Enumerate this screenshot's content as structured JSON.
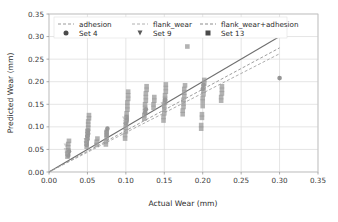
{
  "chart_data": {
    "type": "scatter",
    "title": "",
    "xlabel": "Actual Wear (mm)",
    "ylabel": "Predicted Wear (mm)",
    "xlim": [
      0.0,
      0.35
    ],
    "ylim": [
      0.0,
      0.35
    ],
    "xticks": [
      "0.00",
      "0.05",
      "0.10",
      "0.15",
      "0.20",
      "0.25",
      "0.30",
      "0.35"
    ],
    "yticks": [
      "0.00",
      "0.05",
      "0.10",
      "0.15",
      "0.20",
      "0.25",
      "0.30",
      "0.35"
    ],
    "xtick_values": [
      0.0,
      0.05,
      0.1,
      0.15,
      0.2,
      0.25,
      0.3,
      0.35
    ],
    "ytick_values": [
      0.0,
      0.05,
      0.1,
      0.15,
      0.2,
      0.25,
      0.3,
      0.35
    ],
    "grid": true,
    "legend_position": "upper center",
    "legend_lines": [
      {
        "label": "adhesion",
        "style": "dashed",
        "color": "#9a9a9a"
      },
      {
        "label": "flank_wear",
        "style": "dashed",
        "color": "#b0b0b0"
      },
      {
        "label": "flank_wear+adhesion",
        "style": "dashed",
        "color": "#8c8c8c"
      }
    ],
    "legend_markers": [
      {
        "label": "Set 4",
        "marker": "circle",
        "color": "#4a4a4a"
      },
      {
        "label": "Set 9",
        "marker": "triangle-down",
        "color": "#5a5a5a"
      },
      {
        "label": "Set 13",
        "marker": "square",
        "color": "#4a4a4a"
      }
    ],
    "trend_lines": [
      {
        "name": "adhesion",
        "style": "dashed",
        "color": "#9d9d9d",
        "x": [
          0.0,
          0.3
        ],
        "y": [
          0.0,
          0.275
        ]
      },
      {
        "name": "flank_wear",
        "style": "solid",
        "color": "#6f6f6f",
        "x": [
          0.0,
          0.3
        ],
        "y": [
          0.0,
          0.3
        ]
      },
      {
        "name": "flank_wear+adhesion",
        "style": "dashed",
        "color": "#adadad",
        "x": [
          0.0,
          0.3
        ],
        "y": [
          0.0,
          0.262
        ]
      }
    ],
    "series": [
      {
        "name": "Set 4",
        "marker": "circle",
        "color": "#7d7d7d",
        "points": [
          [
            0.025,
            0.036
          ],
          [
            0.025,
            0.04
          ],
          [
            0.026,
            0.046
          ],
          [
            0.049,
            0.06
          ],
          [
            0.049,
            0.066
          ],
          [
            0.05,
            0.072
          ],
          [
            0.05,
            0.079
          ],
          [
            0.051,
            0.085
          ],
          [
            0.051,
            0.092
          ],
          [
            0.075,
            0.082
          ],
          [
            0.075,
            0.089
          ],
          [
            0.076,
            0.096
          ],
          [
            0.1,
            0.108
          ],
          [
            0.101,
            0.115
          ],
          [
            0.101,
            0.122
          ],
          [
            0.125,
            0.131
          ],
          [
            0.126,
            0.139
          ],
          [
            0.15,
            0.152
          ],
          [
            0.151,
            0.16
          ],
          [
            0.2,
            0.184
          ],
          [
            0.201,
            0.193
          ],
          [
            0.3,
            0.208
          ]
        ]
      },
      {
        "name": "Set 9",
        "marker": "triangle-down",
        "color": "#c2c2c2",
        "points": [
          [
            0.022,
            0.058
          ],
          [
            0.022,
            0.048
          ],
          [
            0.023,
            0.04
          ],
          [
            0.048,
            0.07
          ],
          [
            0.048,
            0.063
          ],
          [
            0.098,
            0.118
          ],
          [
            0.099,
            0.11
          ],
          [
            0.148,
            0.15
          ],
          [
            0.149,
            0.142
          ]
        ]
      },
      {
        "name": "Set 13",
        "marker": "square",
        "color": "#9a9a9a",
        "points": [
          [
            0.024,
            0.034
          ],
          [
            0.024,
            0.041
          ],
          [
            0.025,
            0.048
          ],
          [
            0.025,
            0.055
          ],
          [
            0.025,
            0.062
          ],
          [
            0.026,
            0.069
          ],
          [
            0.049,
            0.056
          ],
          [
            0.049,
            0.063
          ],
          [
            0.049,
            0.07
          ],
          [
            0.05,
            0.077
          ],
          [
            0.05,
            0.084
          ],
          [
            0.05,
            0.091
          ],
          [
            0.051,
            0.098
          ],
          [
            0.051,
            0.105
          ],
          [
            0.051,
            0.112
          ],
          [
            0.052,
            0.119
          ],
          [
            0.052,
            0.126
          ],
          [
            0.062,
            0.06
          ],
          [
            0.062,
            0.067
          ],
          [
            0.063,
            0.074
          ],
          [
            0.074,
            0.061
          ],
          [
            0.074,
            0.068
          ],
          [
            0.075,
            0.075
          ],
          [
            0.075,
            0.082
          ],
          [
            0.075,
            0.089
          ],
          [
            0.099,
            0.074
          ],
          [
            0.099,
            0.082
          ],
          [
            0.1,
            0.09
          ],
          [
            0.1,
            0.098
          ],
          [
            0.1,
            0.106
          ],
          [
            0.101,
            0.114
          ],
          [
            0.101,
            0.122
          ],
          [
            0.101,
            0.13
          ],
          [
            0.102,
            0.138
          ],
          [
            0.102,
            0.146
          ],
          [
            0.102,
            0.154
          ],
          [
            0.103,
            0.162
          ],
          [
            0.103,
            0.17
          ],
          [
            0.103,
            0.178
          ],
          [
            0.124,
            0.118
          ],
          [
            0.124,
            0.126
          ],
          [
            0.125,
            0.134
          ],
          [
            0.125,
            0.142
          ],
          [
            0.125,
            0.15
          ],
          [
            0.126,
            0.158
          ],
          [
            0.126,
            0.166
          ],
          [
            0.126,
            0.174
          ],
          [
            0.127,
            0.182
          ],
          [
            0.127,
            0.19
          ],
          [
            0.136,
            0.142
          ],
          [
            0.136,
            0.15
          ],
          [
            0.137,
            0.158
          ],
          [
            0.137,
            0.166
          ],
          [
            0.149,
            0.114
          ],
          [
            0.149,
            0.122
          ],
          [
            0.15,
            0.13
          ],
          [
            0.15,
            0.138
          ],
          [
            0.15,
            0.146
          ],
          [
            0.151,
            0.154
          ],
          [
            0.151,
            0.162
          ],
          [
            0.151,
            0.17
          ],
          [
            0.152,
            0.178
          ],
          [
            0.152,
            0.186
          ],
          [
            0.152,
            0.194
          ],
          [
            0.174,
            0.128
          ],
          [
            0.174,
            0.136
          ],
          [
            0.175,
            0.144
          ],
          [
            0.175,
            0.152
          ],
          [
            0.175,
            0.16
          ],
          [
            0.176,
            0.168
          ],
          [
            0.176,
            0.176
          ],
          [
            0.176,
            0.184
          ],
          [
            0.177,
            0.192
          ],
          [
            0.18,
            0.278
          ],
          [
            0.198,
            0.096
          ],
          [
            0.198,
            0.104
          ],
          [
            0.199,
            0.12
          ],
          [
            0.199,
            0.128
          ],
          [
            0.2,
            0.146
          ],
          [
            0.2,
            0.156
          ],
          [
            0.2,
            0.164
          ],
          [
            0.201,
            0.172
          ],
          [
            0.201,
            0.18
          ],
          [
            0.201,
            0.188
          ],
          [
            0.202,
            0.196
          ],
          [
            0.202,
            0.204
          ],
          [
            0.224,
            0.158
          ],
          [
            0.224,
            0.166
          ],
          [
            0.225,
            0.174
          ],
          [
            0.225,
            0.182
          ],
          [
            0.225,
            0.19
          ]
        ]
      }
    ]
  },
  "axes": {
    "xlabel": "Actual Wear (mm)",
    "ylabel": "Predicted Wear (mm)"
  }
}
